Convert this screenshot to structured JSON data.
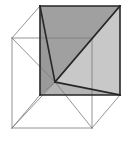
{
  "figure": {
    "type": "line-drawing",
    "background_color": "#ffffff",
    "canvas": {
      "width": 132,
      "height": 145
    }
  },
  "geometry": {
    "description": "Cube drawn in oblique/cabinet projection. Front square face is drawn with heavy outline; back square face is offset up and to the left with thin outline. Interior diagonals converge at the back-bottom-left vertex.",
    "vertices": {
      "front_top_left": {
        "x": 40,
        "y": 6
      },
      "front_top_right": {
        "x": 120,
        "y": 6
      },
      "front_bottom_right": {
        "x": 120,
        "y": 95
      },
      "front_bottom_left": {
        "x": 40,
        "y": 95
      },
      "back_top_left": {
        "x": 12,
        "y": 38
      },
      "back_top_right": {
        "x": 92,
        "y": 38
      },
      "back_bottom_right": {
        "x": 92,
        "y": 128
      },
      "back_bottom_left": {
        "x": 12,
        "y": 128
      },
      "inner_convergence": {
        "x": 55,
        "y": 82
      }
    },
    "faces": [
      {
        "name": "upper-dark-triangle",
        "fill": "#a0a0a0",
        "points": "40,6 120,6 55,82"
      },
      {
        "name": "right-light-triangle",
        "fill": "#c8c8c8",
        "points": "120,6 120,95 55,82"
      },
      {
        "name": "lower-mid-triangle",
        "fill": "#b4b4b4",
        "points": "55,82 120,95 40,95"
      },
      {
        "name": "left-sliver-triangle",
        "fill": "#9a9a9a",
        "points": "40,6 55,82 40,95"
      }
    ],
    "edges": {
      "front_face_outline": [
        {
          "name": "front-top-edge",
          "x1": 40,
          "y1": 6,
          "x2": 120,
          "y2": 6,
          "weight": "heavy"
        },
        {
          "name": "front-right-edge",
          "x1": 120,
          "y1": 6,
          "x2": 120,
          "y2": 95,
          "weight": "heavy"
        },
        {
          "name": "front-bottom-edge",
          "x1": 120,
          "y1": 95,
          "x2": 40,
          "y2": 95,
          "weight": "heavy"
        },
        {
          "name": "front-left-edge",
          "x1": 40,
          "y1": 95,
          "x2": 40,
          "y2": 6,
          "weight": "heavy"
        }
      ],
      "back_face_outline": [
        {
          "name": "back-top-edge",
          "x1": 12,
          "y1": 38,
          "x2": 92,
          "y2": 38,
          "weight": "thin"
        },
        {
          "name": "back-right-edge",
          "x1": 92,
          "y1": 38,
          "x2": 92,
          "y2": 128,
          "weight": "thin"
        },
        {
          "name": "back-bottom-edge",
          "x1": 92,
          "y1": 128,
          "x2": 12,
          "y2": 128,
          "weight": "thin"
        },
        {
          "name": "back-left-edge",
          "x1": 12,
          "y1": 128,
          "x2": 12,
          "y2": 38,
          "weight": "thin"
        }
      ],
      "connecting_edges": [
        {
          "name": "connector-top-left",
          "x1": 40,
          "y1": 6,
          "x2": 12,
          "y2": 38,
          "weight": "thin"
        },
        {
          "name": "connector-top-right",
          "x1": 120,
          "y1": 6,
          "x2": 92,
          "y2": 38,
          "weight": "thin"
        },
        {
          "name": "connector-bottom-right",
          "x1": 120,
          "y1": 95,
          "x2": 92,
          "y2": 128,
          "weight": "thin"
        },
        {
          "name": "connector-bottom-left",
          "x1": 40,
          "y1": 95,
          "x2": 12,
          "y2": 128,
          "weight": "thin"
        }
      ],
      "internal_diagonals": [
        {
          "name": "diagonal-ftl-to-center",
          "x1": 40,
          "y1": 6,
          "x2": 55,
          "y2": 82,
          "weight": "heavy"
        },
        {
          "name": "diagonal-ftr-to-center",
          "x1": 120,
          "y1": 6,
          "x2": 55,
          "y2": 82,
          "weight": "heavy"
        },
        {
          "name": "diagonal-fbr-to-center",
          "x1": 120,
          "y1": 95,
          "x2": 55,
          "y2": 82,
          "weight": "heavy"
        },
        {
          "name": "diagonal-fbl-to-center",
          "x1": 40,
          "y1": 95,
          "x2": 55,
          "y2": 82,
          "weight": "thin"
        },
        {
          "name": "diagonal-center-to-bbl",
          "x1": 55,
          "y1": 82,
          "x2": 12,
          "y2": 128,
          "weight": "thin"
        },
        {
          "name": "diagonal-center-to-bbr",
          "x1": 55,
          "y1": 82,
          "x2": 92,
          "y2": 128,
          "weight": "thin"
        },
        {
          "name": "diagonal-center-to-btl",
          "x1": 55,
          "y1": 82,
          "x2": 12,
          "y2": 38,
          "weight": "thin"
        },
        {
          "name": "diagonal-center-to-btr",
          "x1": 55,
          "y1": 82,
          "x2": 92,
          "y2": 38,
          "weight": "thin"
        }
      ]
    },
    "stroke_colors": {
      "heavy": "#262626",
      "thin": "#787878"
    },
    "stroke_widths": {
      "heavy": 1.6,
      "thin": 0.8
    }
  }
}
